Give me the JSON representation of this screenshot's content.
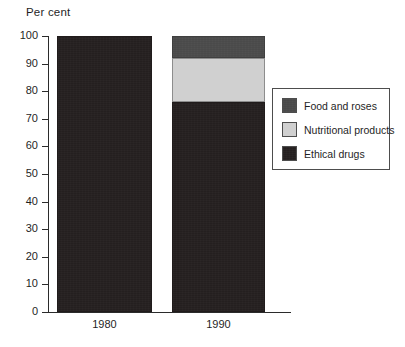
{
  "chart_data": {
    "type": "bar",
    "subtype": "stacked-percentage",
    "title": "Per cent",
    "xlabel": "",
    "ylabel": "Per cent",
    "categories": [
      "1980",
      "1990"
    ],
    "ylim": [
      0,
      100
    ],
    "yticks": [
      0,
      10,
      20,
      30,
      40,
      50,
      60,
      70,
      80,
      90,
      100
    ],
    "ytick_labels": [
      "0",
      "10",
      "20",
      "30",
      "40",
      "50",
      "60",
      "70",
      "80",
      "90",
      "100"
    ],
    "grid": false,
    "legend_position": "right",
    "series": [
      {
        "name": "Ethical drugs",
        "color": "#241f1f",
        "values": [
          100,
          76
        ]
      },
      {
        "name": "Nutritional products",
        "color": "#d0d0d0",
        "values": [
          0,
          16
        ]
      },
      {
        "name": "Food and roses",
        "color": "#4a4a4a",
        "values": [
          0,
          8
        ]
      }
    ],
    "stack_order_bottom_to_top": [
      "Ethical drugs",
      "Nutritional products",
      "Food and roses"
    ],
    "segment_boundaries": {
      "1980": [
        [
          0,
          100
        ]
      ],
      "1990": [
        [
          0,
          76
        ],
        [
          76,
          92
        ],
        [
          92,
          100
        ]
      ]
    }
  },
  "legend": {
    "entries": [
      {
        "label": "Food and roses",
        "color": "#4a4a4a"
      },
      {
        "label": "Nutritional products",
        "color": "#d0d0d0"
      },
      {
        "label": "Ethical drugs",
        "color": "#241f1f"
      }
    ]
  },
  "axis": {
    "title": "Per cent"
  }
}
